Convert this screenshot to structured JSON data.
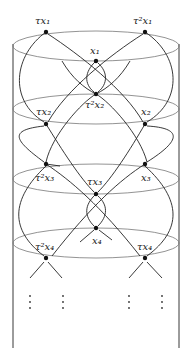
{
  "diagram": {
    "type": "cylinder-orbit-diagram",
    "colors": {
      "stroke": "#222222",
      "ellipse": "#777777",
      "background": "#ffffff"
    },
    "cylinder": {
      "left_x": 13,
      "right_x": 179,
      "top_y": 44,
      "bottom_y": 348
    },
    "ellipses": [
      {
        "cx": 96,
        "cy": 46,
        "rx": 83,
        "ry": 15
      },
      {
        "cx": 96,
        "cy": 109,
        "rx": 83,
        "ry": 15
      },
      {
        "cx": 96,
        "cy": 179,
        "rx": 83,
        "ry": 15
      },
      {
        "cx": 96,
        "cy": 243,
        "rx": 83,
        "ry": 15
      }
    ],
    "nodes": [
      {
        "id": "tx1",
        "x": 46,
        "y": 32,
        "base": "τx",
        "sup": "",
        "sub": "1",
        "lx": 34,
        "ly": 22
      },
      {
        "id": "t2x1",
        "x": 145,
        "y": 32,
        "base": "τ",
        "sup": "2",
        "sub": "1",
        "lx": 134,
        "ly": 22
      },
      {
        "id": "x1",
        "x": 96,
        "y": 61,
        "base": "x",
        "sup": "",
        "sub": "1",
        "lx": 90,
        "ly": 53
      },
      {
        "id": "t2x2",
        "x": 96,
        "y": 94,
        "base": "τ",
        "sup": "2",
        "sub": "2",
        "lx": 86,
        "ly": 108
      },
      {
        "id": "tx2",
        "x": 46,
        "y": 124,
        "base": "τx",
        "sup": "",
        "sub": "2",
        "lx": 36,
        "ly": 116
      },
      {
        "id": "x2",
        "x": 145,
        "y": 124,
        "base": "x",
        "sup": "",
        "sub": "2",
        "lx": 140,
        "ly": 116
      },
      {
        "id": "t2x3",
        "x": 46,
        "y": 164,
        "base": "τ",
        "sup": "2",
        "sub": "3",
        "lx": 36,
        "ly": 178
      },
      {
        "id": "x3",
        "x": 145,
        "y": 164,
        "base": "x",
        "sup": "",
        "sub": "3",
        "lx": 140,
        "ly": 178
      },
      {
        "id": "tx3",
        "x": 96,
        "y": 194,
        "base": "τx",
        "sup": "",
        "sub": "3",
        "lx": 88,
        "ly": 183
      },
      {
        "id": "x4",
        "x": 96,
        "y": 228,
        "base": "x",
        "sup": "",
        "sub": "4",
        "lx": 91,
        "ly": 243
      },
      {
        "id": "t2x4",
        "x": 46,
        "y": 258,
        "base": "τ",
        "sup": "2",
        "sub": "4",
        "lx": 35,
        "ly": 248
      },
      {
        "id": "tx4",
        "x": 145,
        "y": 258,
        "base": "τx",
        "sup": "",
        "sub": "4",
        "lx": 137,
        "ly": 248
      }
    ],
    "labels": {
      "tx1": "τx₁",
      "t2x1": "τ²x₁",
      "x1": "x₁",
      "t2x2": "τ²x₂",
      "tx2": "τx₂",
      "x2": "x₂",
      "t2x3": "τ²x₃",
      "x3": "x₃",
      "tx3": "τx₃",
      "x4": "x₄",
      "t2x4": "τ²x₄",
      "tx4": "τx₄"
    },
    "continuation": "⋮"
  }
}
